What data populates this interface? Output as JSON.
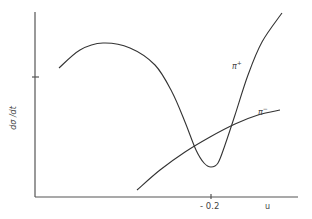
{
  "chart_data": {
    "type": "line",
    "title": "",
    "xlabel": "u",
    "ylabel": "dσ/dt",
    "x_ticks": [
      "-0.2"
    ],
    "y_ticks": [
      ""
    ],
    "grid": false,
    "legend": "inline labels",
    "series": [
      {
        "name": "π+",
        "label_base": "π",
        "label_sup": "+",
        "shape": "rises from left to a broad maximum, falls steeply to a sharp dip near u = -0.2, then rises steeply",
        "points_px": [
          [
            59,
            68
          ],
          [
            80,
            50
          ],
          [
            103,
            43
          ],
          [
            130,
            48
          ],
          [
            155,
            65
          ],
          [
            172,
            92
          ],
          [
            185,
            122
          ],
          [
            196,
            150
          ],
          [
            204,
            163
          ],
          [
            211,
            167
          ],
          [
            218,
            163
          ],
          [
            225,
            145
          ],
          [
            235,
            115
          ],
          [
            248,
            75
          ],
          [
            262,
            42
          ],
          [
            282,
            13
          ]
        ]
      },
      {
        "name": "π-",
        "label_base": "π",
        "label_sup": "−",
        "shape": "monotonically increasing, concave down",
        "points_px": [
          [
            137,
            190
          ],
          [
            160,
            170
          ],
          [
            185,
            152
          ],
          [
            210,
            137
          ],
          [
            235,
            124
          ],
          [
            258,
            115
          ],
          [
            280,
            110
          ]
        ]
      }
    ],
    "annotations": [
      "dip of π+ cross section at u ≈ -0.2"
    ]
  },
  "labels": {
    "ylabel": "dσ /dt",
    "xtick": "- 0.2",
    "xlabel": "u",
    "pi_plus_base": "π",
    "pi_plus_sup": "+",
    "pi_minus_base": "π",
    "pi_minus_sup": "−"
  }
}
